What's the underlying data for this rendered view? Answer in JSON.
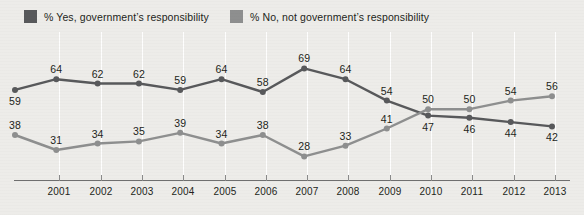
{
  "legend": {
    "items": [
      {
        "label": "% Yes, government’s responsibility",
        "color": "#58595b",
        "key": "yes"
      },
      {
        "label": "% No, not government’s responsibility",
        "color": "#8e8f8f",
        "key": "no"
      }
    ]
  },
  "axis": {
    "tick_labels": [
      "2001",
      "2002",
      "2003",
      "2004",
      "2005",
      "2006",
      "2007",
      "2008",
      "2009",
      "2010",
      "2011",
      "2012",
      "2013"
    ]
  },
  "chart_data": {
    "type": "line",
    "title": "",
    "xlabel": "",
    "ylabel": "",
    "grid": true,
    "legend_position": "top-left",
    "x": [
      "2000",
      "2001",
      "2002",
      "2003",
      "2004",
      "2005",
      "2006",
      "2007",
      "2008",
      "2009",
      "2010",
      "2011",
      "2012",
      "2013"
    ],
    "tick_labels": [
      "2001",
      "2002",
      "2003",
      "2004",
      "2005",
      "2006",
      "2007",
      "2008",
      "2009",
      "2010",
      "2011",
      "2012",
      "2013"
    ],
    "ylim": [
      20,
      75
    ],
    "series": [
      {
        "name": "% Yes, government’s responsibility",
        "color": "#58595b",
        "values": [
          59,
          64,
          62,
          62,
          59,
          64,
          58,
          69,
          64,
          54,
          47,
          46,
          44,
          42
        ],
        "label_positions": [
          "below",
          "above",
          "above",
          "above",
          "above",
          "above",
          "above",
          "above",
          "above",
          "above",
          "below",
          "below",
          "below",
          "below"
        ]
      },
      {
        "name": "% No, not government’s responsibility",
        "color": "#8e8f8f",
        "values": [
          38,
          31,
          34,
          35,
          39,
          34,
          38,
          28,
          33,
          41,
          50,
          50,
          54,
          56
        ],
        "label_positions": [
          "above",
          "above",
          "above",
          "above",
          "above",
          "above",
          "above",
          "above",
          "above",
          "above",
          "above",
          "above",
          "above",
          "above"
        ]
      }
    ]
  },
  "colors": {
    "background": "#edece9",
    "gridline": "#ffffff",
    "axis": "#6f6f6f",
    "series_yes": "#58595b",
    "series_no": "#8e8f8f",
    "text": "#231f20"
  }
}
